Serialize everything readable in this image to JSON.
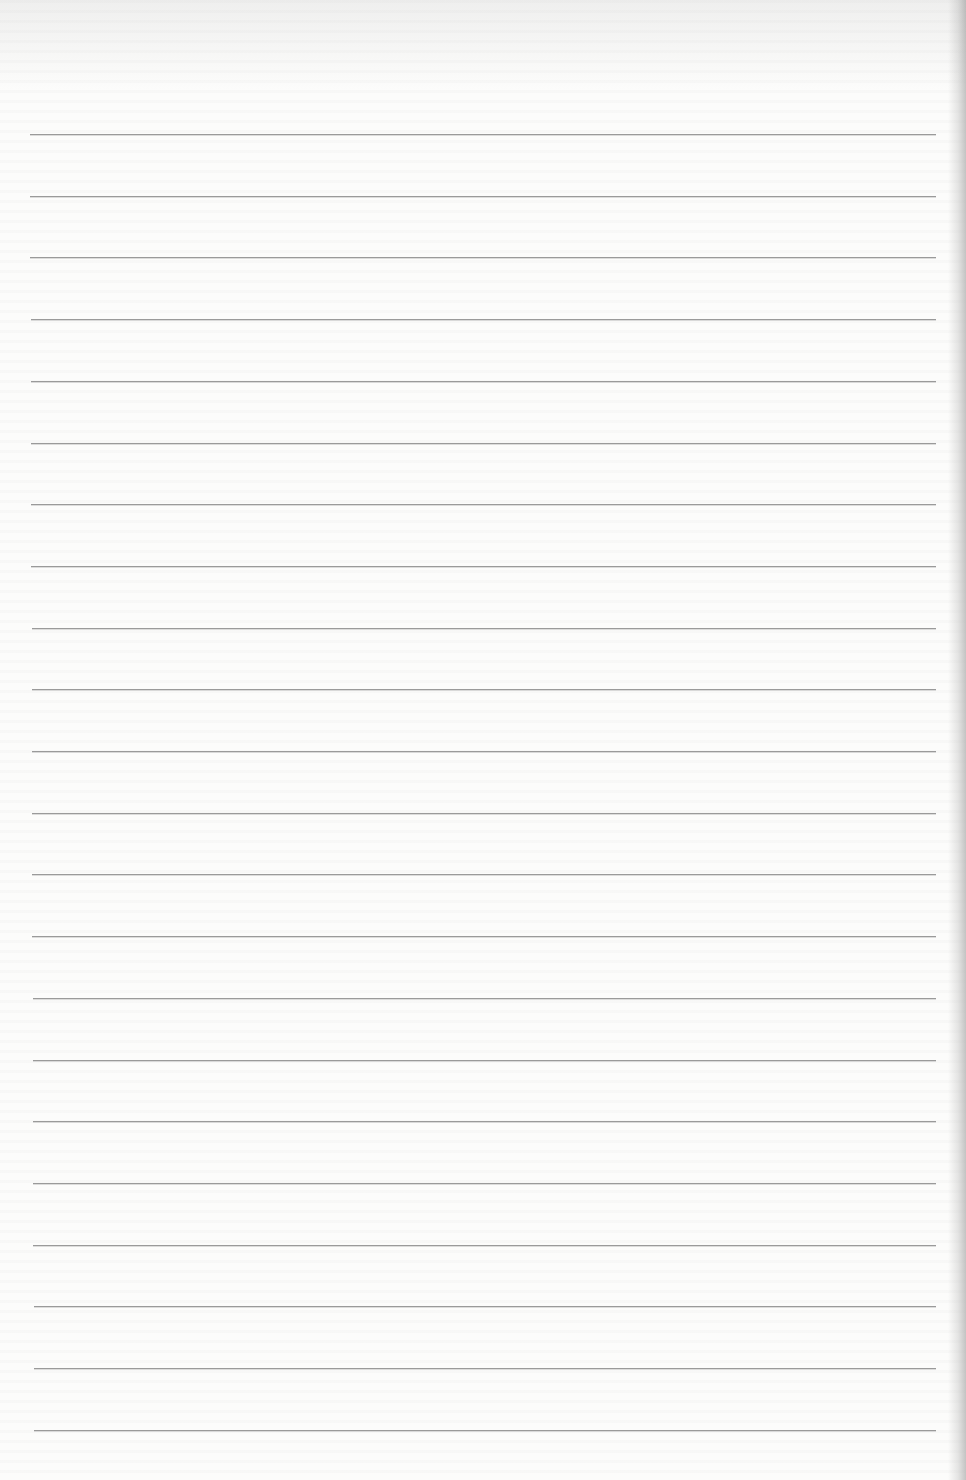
{
  "page": {
    "type": "ruled-notebook-page",
    "line_count": 22,
    "first_line_y": 134,
    "line_spacing": 61.7,
    "line_left_top": 30,
    "line_left_bottom": 34,
    "line_right": 936,
    "line_color": "#9a9a9a",
    "paper_color": "#fcfcfb",
    "text": ""
  }
}
